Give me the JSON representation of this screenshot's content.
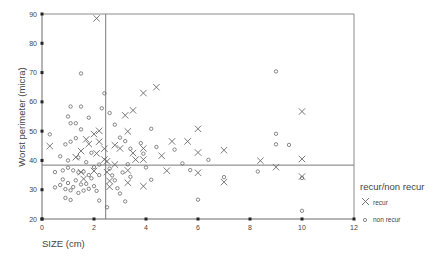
{
  "chart_data": {
    "type": "scatter",
    "title": "",
    "xlabel": "SIZE (cm)",
    "ylabel": "Worst perimeter (micra)",
    "xlim": [
      0,
      12
    ],
    "ylim": [
      20,
      90
    ],
    "x_ticks": [
      0,
      2,
      4,
      6,
      8,
      10,
      12
    ],
    "y_ticks": [
      20,
      30,
      40,
      50,
      60,
      70,
      80,
      90
    ],
    "grid": false,
    "reference_lines": {
      "vertical_x": 2.45,
      "horizontal_y": 38.4
    },
    "legend": {
      "title": "recur/non recur",
      "position": "right",
      "entries": [
        {
          "label": "recur",
          "marker": "x"
        },
        {
          "label": "non recur",
          "marker": "o"
        }
      ]
    },
    "series": [
      {
        "name": "recur",
        "marker": "x",
        "points": [
          [
            2.1,
            88.5
          ],
          [
            0.3,
            44.9
          ],
          [
            1.3,
            41.1
          ],
          [
            1.5,
            43.2
          ],
          [
            1.7,
            47.2
          ],
          [
            1.8,
            45.6
          ],
          [
            2.0,
            49.0
          ],
          [
            2.1,
            42.4
          ],
          [
            2.2,
            46.4
          ],
          [
            2.2,
            50.1
          ],
          [
            2.4,
            40.3
          ],
          [
            2.4,
            44.0
          ],
          [
            1.5,
            36.0
          ],
          [
            1.6,
            33.7
          ],
          [
            2.0,
            36.4
          ],
          [
            2.5,
            39.7
          ],
          [
            2.5,
            36.0
          ],
          [
            2.6,
            33.0
          ],
          [
            2.6,
            31.0
          ],
          [
            2.8,
            45.2
          ],
          [
            2.8,
            38.6
          ],
          [
            3.0,
            44.1
          ],
          [
            3.2,
            55.4
          ],
          [
            3.3,
            49.9
          ],
          [
            3.5,
            42.5
          ],
          [
            3.3,
            36.6
          ],
          [
            3.3,
            32.4
          ],
          [
            3.5,
            57.1
          ],
          [
            3.6,
            40.3
          ],
          [
            3.9,
            63.0
          ],
          [
            3.9,
            44.1
          ],
          [
            3.9,
            40.3
          ],
          [
            3.9,
            31.2
          ],
          [
            4.4,
            65.0
          ],
          [
            4.6,
            41.6
          ],
          [
            4.8,
            36.5
          ],
          [
            5.0,
            46.5
          ],
          [
            5.6,
            46.5
          ],
          [
            6.0,
            50.8
          ],
          [
            6.0,
            42.7
          ],
          [
            6.0,
            35.8
          ],
          [
            7.0,
            43.5
          ],
          [
            7.0,
            32.6
          ],
          [
            8.4,
            39.9
          ],
          [
            9.0,
            37.7
          ],
          [
            10.0,
            56.7
          ],
          [
            10.0,
            40.5
          ],
          [
            10.0,
            34.5
          ]
        ]
      },
      {
        "name": "non recur",
        "marker": "o",
        "points": [
          [
            1.5,
            69.7
          ],
          [
            1.1,
            58.4
          ],
          [
            1.5,
            58.4
          ],
          [
            1.0,
            55.0
          ],
          [
            1.8,
            54.6
          ],
          [
            1.1,
            52.7
          ],
          [
            1.3,
            52.7
          ],
          [
            1.5,
            50.6
          ],
          [
            0.3,
            48.9
          ],
          [
            0.9,
            45.5
          ],
          [
            1.1,
            46.4
          ],
          [
            1.3,
            47.6
          ],
          [
            0.7,
            41.4
          ],
          [
            1.0,
            40.0
          ],
          [
            1.4,
            41.0
          ],
          [
            1.7,
            39.4
          ],
          [
            1.9,
            42.6
          ],
          [
            2.2,
            38.6
          ],
          [
            0.5,
            36.0
          ],
          [
            0.8,
            36.6
          ],
          [
            1.0,
            37.5
          ],
          [
            1.2,
            36.6
          ],
          [
            1.4,
            35.9
          ],
          [
            1.6,
            36.2
          ],
          [
            1.8,
            35.0
          ],
          [
            2.0,
            37.7
          ],
          [
            2.2,
            35.0
          ],
          [
            0.5,
            30.8
          ],
          [
            0.7,
            31.6
          ],
          [
            0.8,
            33.5
          ],
          [
            0.9,
            30.2
          ],
          [
            1.0,
            32.3
          ],
          [
            1.1,
            29.8
          ],
          [
            1.2,
            30.9
          ],
          [
            1.3,
            33.2
          ],
          [
            1.4,
            28.9
          ],
          [
            1.5,
            31.8
          ],
          [
            1.6,
            29.7
          ],
          [
            1.7,
            32.0
          ],
          [
            1.8,
            30.3
          ],
          [
            1.9,
            33.9
          ],
          [
            2.0,
            31.2
          ],
          [
            2.1,
            29.6
          ],
          [
            2.2,
            26.3
          ],
          [
            0.9,
            27.2
          ],
          [
            1.1,
            26.5
          ],
          [
            2.3,
            57.8
          ],
          [
            2.4,
            62.9
          ],
          [
            2.6,
            56.2
          ],
          [
            2.8,
            52.2
          ],
          [
            3.0,
            47.8
          ],
          [
            3.2,
            46.6
          ],
          [
            3.4,
            44.0
          ],
          [
            2.6,
            37.2
          ],
          [
            2.7,
            34.9
          ],
          [
            2.8,
            33.2
          ],
          [
            2.9,
            30.5
          ],
          [
            3.0,
            28.7
          ],
          [
            3.1,
            35.9
          ],
          [
            3.3,
            38.7
          ],
          [
            3.4,
            34.4
          ],
          [
            2.5,
            24.0
          ],
          [
            3.2,
            26.0
          ],
          [
            3.8,
            45.9
          ],
          [
            3.9,
            42.3
          ],
          [
            4.0,
            37.6
          ],
          [
            4.2,
            50.8
          ],
          [
            4.4,
            44.6
          ],
          [
            4.2,
            33.4
          ],
          [
            5.1,
            43.7
          ],
          [
            5.4,
            39.0
          ],
          [
            5.7,
            36.7
          ],
          [
            6.0,
            26.6
          ],
          [
            6.4,
            40.2
          ],
          [
            7.0,
            34.3
          ],
          [
            8.3,
            36.2
          ],
          [
            9.0,
            45.5
          ],
          [
            9.0,
            49.1
          ],
          [
            9.5,
            45.3
          ],
          [
            9.0,
            70.4
          ],
          [
            10.0,
            34.0
          ],
          [
            10.0,
            22.8
          ]
        ]
      }
    ]
  },
  "axes": {
    "x_label": "SIZE (cm)",
    "y_label": "Worst perimeter (micra)",
    "x_tick_labels": [
      "0",
      "2",
      "4",
      "6",
      "8",
      "10",
      "12"
    ],
    "y_tick_labels": [
      "20",
      "30",
      "40",
      "50",
      "60",
      "70",
      "80",
      "90"
    ]
  },
  "legend": {
    "title": "recur/non recur",
    "items": [
      {
        "label": "recur",
        "symbol": "x-marker-icon"
      },
      {
        "label": "non recur",
        "symbol": "circle-marker-icon"
      }
    ]
  },
  "colors": {
    "frame": "#7a7a7a",
    "marker": "#6a6a6a",
    "text": "#444444",
    "background": "#ffffff"
  }
}
